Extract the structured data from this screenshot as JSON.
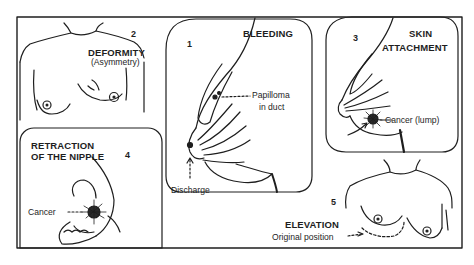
{
  "figure": {
    "colors": {
      "ink": "#1e1e1e",
      "background": "#ffffff"
    }
  },
  "panels": [
    {
      "number": "1",
      "title": "BLEEDING",
      "labels": [
        "Papilloma",
        "in duct",
        "Discharge"
      ]
    },
    {
      "number": "2",
      "title": "DEFORMITY",
      "subtitle": "(Asymmetry)"
    },
    {
      "number": "3",
      "title_line1": "SKIN",
      "title_line2": "ATTACHMENT",
      "labels": [
        "Cancer (lump)"
      ]
    },
    {
      "number": "4",
      "title_line1": "RETRACTION",
      "title_line2": "OF THE NIPPLE",
      "labels": [
        "Cancer"
      ]
    },
    {
      "number": "5",
      "title": "ELEVATION",
      "labels": [
        "Original position"
      ]
    }
  ]
}
